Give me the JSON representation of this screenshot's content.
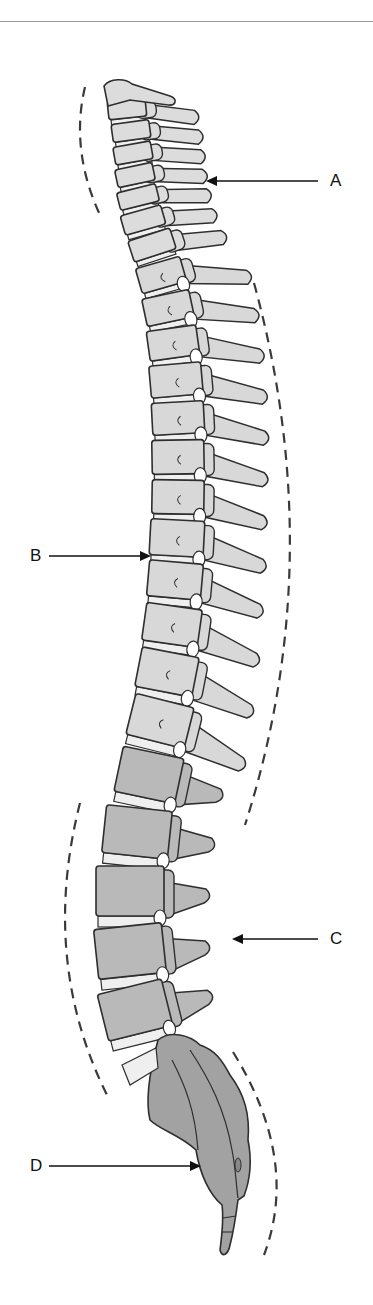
{
  "figure": {
    "labels": [
      {
        "id": "A",
        "text": "A",
        "points_to": "cervical curve",
        "side": "right"
      },
      {
        "id": "B",
        "text": "B",
        "points_to": "thoracic curve",
        "side": "left"
      },
      {
        "id": "C",
        "text": "C",
        "points_to": "lumbar curve",
        "side": "right"
      },
      {
        "id": "D",
        "text": "D",
        "points_to": "sacral / coccygeal curve",
        "side": "left"
      }
    ],
    "regions": {
      "cervical": {
        "count": 7,
        "fill": "#dcdcdc"
      },
      "thoracic": {
        "count": 12,
        "fill": "#d8d8d8"
      },
      "lumbar": {
        "count": 5,
        "fill": "#b9b9b9"
      },
      "sacrum_coccyx": {
        "fill": "#a2a2a2"
      }
    },
    "colors": {
      "outline": "#2e2e2e",
      "disc": "#efefef",
      "dashed_curve": "#3a3a3a",
      "arrow": "#111111",
      "rule": "#9a9a9a"
    }
  }
}
